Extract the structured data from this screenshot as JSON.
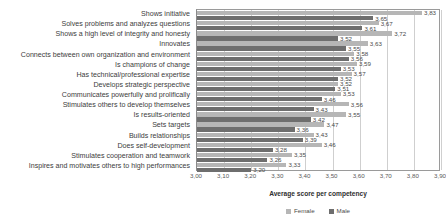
{
  "chart_data": {
    "type": "bar",
    "orientation": "horizontal",
    "title": "",
    "xlabel": "Average score per competency",
    "ylabel": "",
    "xlim": [
      3.0,
      3.9
    ],
    "xticks": [
      "3,00",
      "3,10",
      "3,20",
      "3,30",
      "3,40",
      "3,50",
      "3,60",
      "3,70",
      "3,80",
      "3,90"
    ],
    "grid": true,
    "legend_position": "bottom",
    "categories": [
      "Shows initiative",
      "Solves problems and analyzes questions",
      "Shows a high level of integrity and honesty",
      "Innovates",
      "Connects between own organization and environment",
      "Is champions of change",
      "Has technical/professional expertise",
      "Develops strategic perspective",
      "Communicates powerfully and prolifically",
      "Stimulates others to develop themselves",
      "Is results-oriented",
      "Sets targets",
      "Builds relationships",
      "Does self-development",
      "Stimulates cooperation and teamwork",
      "Inspires and motivates others to high performances"
    ],
    "series": [
      {
        "name": "Female",
        "color": "#b6b6b6",
        "values": [
          3.83,
          3.67,
          3.72,
          3.63,
          3.58,
          3.59,
          3.57,
          3.52,
          3.53,
          3.56,
          3.55,
          3.47,
          3.43,
          3.46,
          3.35,
          3.33
        ],
        "labels": [
          "3,83",
          "3,67",
          "3,72",
          "3,63",
          "3,58",
          "3,59",
          "3,57",
          "3,52",
          "3,53",
          "3,56",
          "3,55",
          "3,47",
          "3,43",
          "3,46",
          "3,35",
          "3,33"
        ]
      },
      {
        "name": "Male",
        "color": "#6e6e6e",
        "values": [
          3.65,
          3.61,
          3.52,
          3.55,
          3.56,
          3.53,
          3.52,
          3.51,
          3.46,
          3.43,
          3.42,
          3.36,
          3.39,
          3.28,
          3.26,
          3.2
        ],
        "labels": [
          "3,65",
          "3,61",
          "3,52",
          "3,55",
          "3,56",
          "3,53",
          "3,52",
          "3,51",
          "3,46",
          "3,43",
          "3,42",
          "3,36",
          "3,39",
          "3,28",
          "3,26",
          "3,20"
        ]
      }
    ],
    "legend": [
      "Female",
      "Male"
    ]
  }
}
